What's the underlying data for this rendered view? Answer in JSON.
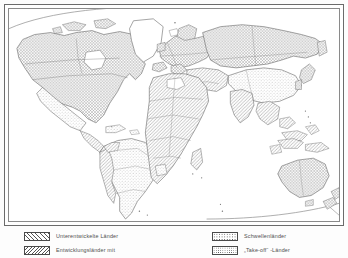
{
  "map": {
    "title": "Weltkarte der Entwicklungsländer",
    "frame_color": "#6b6b6b",
    "land_outline_color": "#555555",
    "background": "#ffffff",
    "projection_arc": "visible",
    "regions": [
      {
        "name": "Nordamerika",
        "pattern": "crosshatch",
        "category": "Industrieländer"
      },
      {
        "name": "Grönland",
        "pattern": "none",
        "category": "keine"
      },
      {
        "name": "Mexiko",
        "pattern": "dots",
        "category": "Schwellenländer"
      },
      {
        "name": "Mittelamerika",
        "pattern": "diagonal",
        "category": "Entwicklungsländer"
      },
      {
        "name": "Südamerika",
        "pattern": "dots",
        "category": "Schwellenländer"
      },
      {
        "name": "Anden-Staaten",
        "pattern": "diagonal",
        "category": "Entwicklungsländer"
      },
      {
        "name": "Westeuropa",
        "pattern": "crosshatch",
        "category": "Industrieländer"
      },
      {
        "name": "Osteuropa",
        "pattern": "crosshatch",
        "category": "Industrieländer"
      },
      {
        "name": "Russland / UdSSR",
        "pattern": "crosshatch",
        "category": "Industrieländer"
      },
      {
        "name": "Nordafrika",
        "pattern": "diagonal",
        "category": "Entwicklungsländer"
      },
      {
        "name": "Zentralafrika",
        "pattern": "diagonal",
        "category": "Entwicklungsländer"
      },
      {
        "name": "Südafrika",
        "pattern": "diagonal",
        "category": "Entwicklungsländer"
      },
      {
        "name": "Naher Osten",
        "pattern": "diagonal",
        "category": "Entwicklungsländer"
      },
      {
        "name": "Indien",
        "pattern": "diagonal",
        "category": "Entwicklungsländer"
      },
      {
        "name": "China",
        "pattern": "dots",
        "category": "Schwellenländer"
      },
      {
        "name": "Japan",
        "pattern": "crosshatch",
        "category": "Industrieländer"
      },
      {
        "name": "Südostasien",
        "pattern": "diagonal",
        "category": "Entwicklungsländer"
      },
      {
        "name": "Australien",
        "pattern": "crosshatch",
        "category": "Industrieländer"
      },
      {
        "name": "Neuseeland",
        "pattern": "crosshatch",
        "category": "Industrieländer"
      }
    ]
  },
  "legend": {
    "left_column": [
      {
        "swatch": "forward-hatch",
        "label": "Unterentwickelte Länder"
      },
      {
        "swatch": "backward-hatch",
        "label": "Entwicklungsländer  mit"
      }
    ],
    "right_column": [
      {
        "swatch": "fine-dots",
        "label": "Schwellenländer"
      },
      {
        "swatch": "coarse-dots",
        "label": "„Take-off“ -Länder"
      }
    ]
  }
}
